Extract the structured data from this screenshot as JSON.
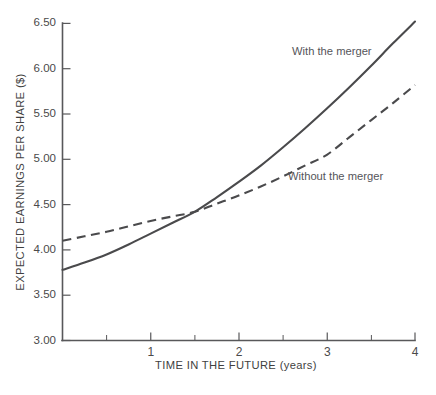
{
  "chart_data": {
    "type": "line",
    "title": "",
    "xlabel": "TIME IN THE FUTURE (years)",
    "ylabel": "EXPECTED EARNINGS PER SHARE ($)",
    "xlim": [
      0,
      4
    ],
    "ylim": [
      3.0,
      6.5
    ],
    "grid": false,
    "legend_position": "inline-annotations",
    "xticks": [
      0,
      1,
      2,
      3,
      4
    ],
    "xtick_labels": [
      "",
      "1",
      "2",
      "3",
      "4"
    ],
    "x_minor_ticks": [
      0.5,
      1.5,
      2.5,
      3.5
    ],
    "yticks": [
      3.0,
      3.5,
      4.0,
      4.5,
      5.0,
      5.5,
      6.0,
      6.5
    ],
    "ytick_labels": [
      "3.00",
      "3.50",
      "4.00",
      "4.50",
      "5.00",
      "5.50",
      "6.00",
      "6.50"
    ],
    "y_minor_ticks": [
      3.25,
      3.75,
      4.25,
      4.75,
      5.25,
      5.75,
      6.25
    ],
    "line_color": "#4a4a4c",
    "series": [
      {
        "name": "With the merger",
        "style": "solid",
        "annotation": "With the merger",
        "x": [
          0,
          0.25,
          0.5,
          0.75,
          1.0,
          1.25,
          1.5,
          1.75,
          2.0,
          2.25,
          2.5,
          2.75,
          3.0,
          3.25,
          3.5,
          3.75,
          4.0
        ],
        "values": [
          3.78,
          3.86,
          3.95,
          4.06,
          4.18,
          4.3,
          4.42,
          4.58,
          4.75,
          4.93,
          5.13,
          5.34,
          5.56,
          5.79,
          6.03,
          6.28,
          6.52
        ]
      },
      {
        "name": "Without the merger",
        "style": "dashed",
        "annotation": "Without the merger",
        "x": [
          0,
          0.25,
          0.5,
          0.75,
          1.0,
          1.25,
          1.5,
          1.75,
          2.0,
          2.25,
          2.5,
          2.75,
          3.0,
          3.25,
          3.5,
          3.75,
          4.0
        ],
        "values": [
          4.1,
          4.15,
          4.2,
          4.26,
          4.32,
          4.37,
          4.42,
          4.51,
          4.6,
          4.7,
          4.81,
          4.93,
          5.05,
          5.24,
          5.43,
          5.62,
          5.82
        ]
      }
    ],
    "crossover": {
      "x": 1.55,
      "y": 4.43
    }
  },
  "annotations": {
    "with_merger": "With the merger",
    "without_merger": "Without the merger"
  }
}
